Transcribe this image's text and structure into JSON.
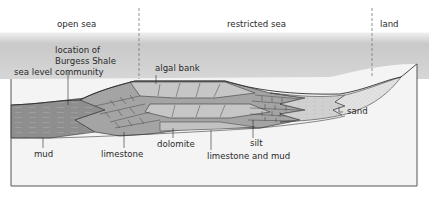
{
  "zones": [
    {
      "label": "open sea",
      "x": 57,
      "y": 24
    },
    {
      "label": "restricted sea",
      "x": 227,
      "y": 24
    },
    {
      "label": "land",
      "x": 380,
      "y": 24
    }
  ],
  "labels": {
    "sea_level": "sea level",
    "burgess_line1": "location of",
    "burgess_line2": "Burgess Shale",
    "burgess_line3": "community",
    "algal_bank": "algal bank",
    "mud": "mud",
    "limestone": "limestone",
    "dolomite": "dolomite",
    "limestone_and_mud": "limestone and mud",
    "silt": "silt",
    "sand": "sand"
  },
  "colors": {
    "sky_top": "#bdbdbd",
    "sky_bottom": "#d8d8d8",
    "mud": "#8f8f8f",
    "limestone": "#a3a3a3",
    "dolomite": "#c4c4c4",
    "silt": "#cfcfcf",
    "sand": "#e3e3e3",
    "outline": "#3a3a3a"
  }
}
